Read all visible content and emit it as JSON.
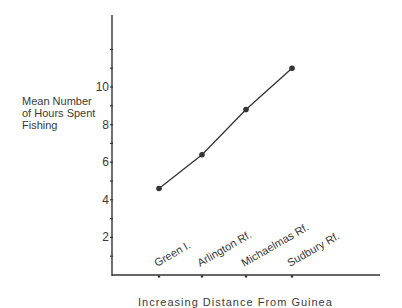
{
  "chart_data": {
    "type": "line",
    "title": "",
    "xlabel": "Increasing Distance From Guinea",
    "ylabel": "Mean Number of Hours Spent Fishing",
    "categories": [
      "Green I.",
      "Arlington Rf.",
      "Michaelmas Rf.",
      "Sudbury Rf."
    ],
    "values": [
      4.6,
      6.4,
      8.8,
      11.0
    ],
    "yticks": [
      2,
      4,
      6,
      8,
      10
    ],
    "ylim": [
      0,
      13.5
    ],
    "grid": false,
    "legend": null,
    "colors": {
      "line": "#333333",
      "axis": "#333333"
    }
  },
  "labels": {
    "ylabel_lines": [
      "Mean Number",
      "of Hours Spent",
      "Fishing"
    ],
    "xtitle": "Increasing Distance From Guinea"
  }
}
